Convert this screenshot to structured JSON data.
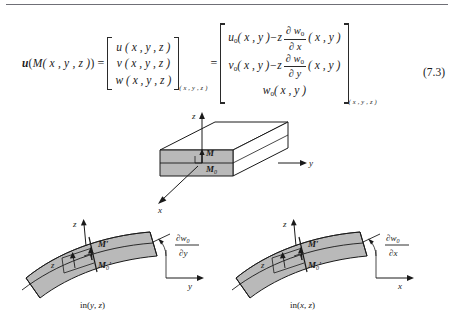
{
  "page": {
    "figure_number": "(7.3)",
    "rule_color": "#6f6f76"
  },
  "equation": {
    "lhs": {
      "vector_u": "u",
      "open": "(",
      "point_M": "M",
      "coords": "( x , y , z )",
      "close": ")",
      "equals": "="
    },
    "matrix1": {
      "rows": [
        "u ( x , y , z )",
        "v ( x , y , z )",
        "w ( x , y , z )"
      ],
      "subscript": "( x , y , z )"
    },
    "equals2": "=",
    "matrix2": {
      "row1": {
        "lead": "u",
        "lead_sub": "0",
        "args": "( x , y )",
        "minus_z": "−z",
        "frac_num_partial": "∂ w",
        "frac_num_sub": "0",
        "frac_den": "∂ x",
        "trail": "( x , y )"
      },
      "row2": {
        "lead": "v",
        "lead_sub": "0",
        "args": "( x , y )",
        "minus_z": "−z",
        "frac_num_partial": "∂ w",
        "frac_num_sub": "0",
        "frac_den": "∂ y",
        "trail": "( x , y )"
      },
      "row3": {
        "lead": "w",
        "lead_sub": "0",
        "args": "( x , y )"
      },
      "subscript": "( x , y , z )"
    }
  },
  "figures": {
    "block3d": {
      "axis_z": "z",
      "axis_y": "y",
      "axis_x": "x",
      "point_M": "M",
      "point_M0": "M",
      "point_M0_sub": "0",
      "face_fill": "#b9b9b9",
      "top_fill": "#ffffff",
      "side_fill": "#ffffff"
    },
    "deformed_yz": {
      "axis_z": "z",
      "axis_h": "y",
      "point_M": "M′",
      "point_M0": "M",
      "point_M0_sub": "0",
      "thickness_label": "z",
      "slope_num_partial": "∂w",
      "slope_num_sub": "0",
      "slope_den": "∂y",
      "caption_prefix": "in(",
      "caption_v1": "y",
      "caption_comma": ", ",
      "caption_v2": "z",
      "caption_suffix": ")",
      "plate_fill": "#b9b9b9"
    },
    "deformed_xz": {
      "axis_z": "z",
      "axis_h": "x",
      "point_M": "M′",
      "point_M0": "M",
      "point_M0_sub": "0",
      "thickness_label": "z",
      "slope_num_partial": "∂w",
      "slope_num_sub": "0",
      "slope_den": "∂x",
      "caption_prefix": "in(",
      "caption_v1": "x",
      "caption_comma": ", ",
      "caption_v2": "z",
      "caption_suffix": ")",
      "plate_fill": "#b9b9b9"
    }
  }
}
